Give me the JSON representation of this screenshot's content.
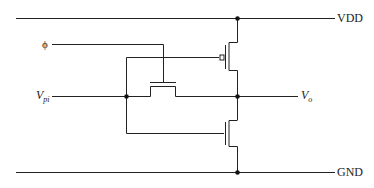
{
  "diagram": {
    "type": "circuit-schematic",
    "labels": {
      "vdd": "VDD",
      "gnd": "GND",
      "clock": "ϕ",
      "input_main": "V",
      "input_sub": "pi",
      "output_main": "V",
      "output_sub": "o"
    },
    "components": [
      {
        "id": "pmos",
        "type": "PMOS transistor",
        "source": "VDD",
        "drain": "Vo",
        "gate": "Vpi"
      },
      {
        "id": "nmos",
        "type": "NMOS transistor",
        "source": "GND",
        "drain": "Vo",
        "gate": "Vpi"
      },
      {
        "id": "pass",
        "type": "NMOS pass transistor",
        "gate": "ϕ",
        "terminals": [
          "Vpi",
          "Vo"
        ]
      }
    ],
    "colors": {
      "wire": "#222222",
      "background": "#ffffff"
    }
  }
}
